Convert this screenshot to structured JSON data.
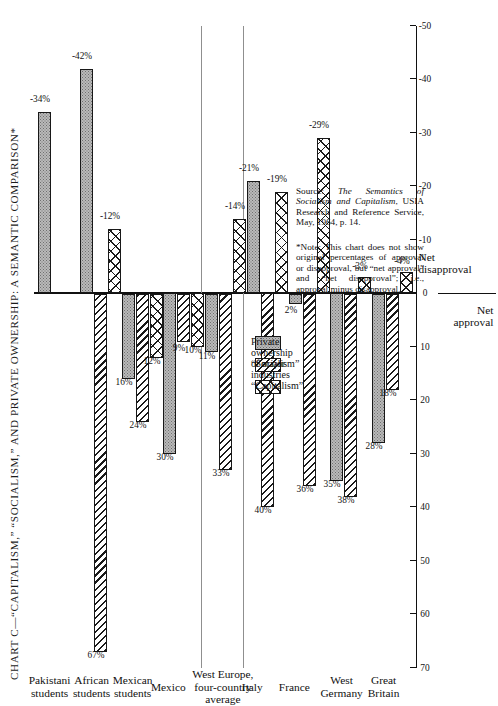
{
  "title": "CHART C—“CAPITALISM,” “SOCIALISM,” AND PRIVATE OWNERSHIP: A SEMANTIC COMPARISON*",
  "axis": {
    "net_approval_label": "Net\napproval",
    "net_disapproval_label": "Net\ndisapproval",
    "ticks": [
      "70",
      "60",
      "50",
      "40",
      "30",
      "20",
      "10",
      "0",
      "-10",
      "-20",
      "-30",
      "-40",
      "-50"
    ],
    "tick_values": [
      70,
      60,
      50,
      40,
      30,
      20,
      10,
      0,
      -10,
      -20,
      -30,
      -40,
      -50
    ]
  },
  "legend": {
    "items": [
      {
        "label": "“Capitalism”",
        "pattern": "cross-hatch"
      },
      {
        "label": "“Socialism”",
        "pattern": "diagonal-hatch"
      },
      {
        "label": "Private ownership\nof major industries",
        "pattern": "grey-stipple"
      }
    ]
  },
  "note": "*Note: This chart does not show original percentages of approval or disapproval, but “net approval” and “net disapproval”; i.e., approval minus disapproval.",
  "source": "Source: The Semantics of Socialism and Capitalism, USIA Research and Reference Service, May, 1964, p. 14.",
  "source_italic": "The Semantics of Socialism and Capitalism",
  "chart_data": {
    "type": "bar",
    "title": "CHART C—“CAPITALISM,” “SOCIALISM,” AND PRIVATE OWNERSHIP: A SEMANTIC COMPARISON*",
    "xlabel": "",
    "ylabel": "Net approval / Net disapproval (percent)",
    "ylim": [
      -50,
      70
    ],
    "grid": false,
    "legend_position": "right-center",
    "orientation": "horizontal-printed-sideways",
    "categories": [
      "Great\nBritain",
      "West\nGermany",
      "France",
      "Italy",
      "West Europe,\nfour-country\naverage",
      "Mexico",
      "Mexican\nstudents",
      "African\nstudents",
      "Pakistani\nstudents"
    ],
    "series": [
      {
        "name": "“Capitalism”",
        "pattern": "cross-hatch",
        "values": [
          -4,
          -3,
          -29,
          -19,
          -14,
          10,
          12,
          -12,
          null
        ],
        "labels": [
          "-4%",
          "-3%",
          "-29%",
          "-19%",
          "-14%",
          "10%",
          "12%",
          "-12%",
          ""
        ]
      },
      {
        "name": "“Socialism”",
        "pattern": "diagonal-hatch",
        "values": [
          18,
          38,
          36,
          40,
          33,
          9,
          24,
          67,
          null
        ],
        "labels": [
          "18%",
          "38%",
          "36%",
          "40%",
          "33%",
          "9%",
          "24%",
          "67%",
          ""
        ]
      },
      {
        "name": "Private ownership of major industries",
        "pattern": "grey-stipple",
        "values": [
          28,
          35,
          2,
          -21,
          11,
          30,
          16,
          -42,
          -34
        ],
        "labels": [
          "28%",
          "35%",
          "2%",
          "-21%",
          "11%",
          "30%",
          "16%",
          "-42%",
          "-34%"
        ]
      }
    ]
  }
}
